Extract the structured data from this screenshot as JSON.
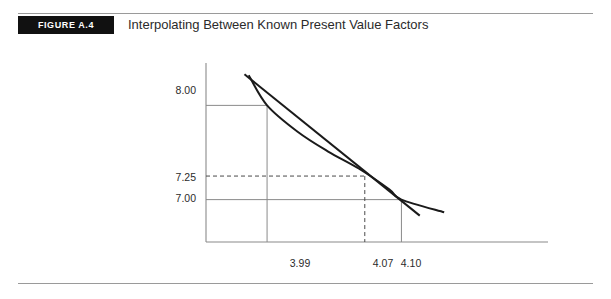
{
  "figure": {
    "tag": "FIGURE A.4",
    "title": "Interpolating Between Known Present Value Factors"
  },
  "chart_data": {
    "type": "line",
    "title": "Interpolating Between Known Present Value Factors",
    "xlabel": "",
    "ylabel": "",
    "grid": true,
    "legend": "none",
    "x_ticks": [
      "3.99",
      "4.07",
      "4.10"
    ],
    "x_tick_values": [
      3.99,
      4.07,
      4.1
    ],
    "y_ticks": [
      "8.00",
      "7.25",
      "7.00"
    ],
    "y_tick_values": [
      8.0,
      7.25,
      7.0
    ],
    "xlim": [
      3.94,
      4.22
    ],
    "ylim": [
      6.55,
      8.45
    ],
    "series": [
      {
        "name": "true-present-value-curve",
        "style": "solid-curve",
        "x": [
          3.975,
          3.99,
          4.015,
          4.04,
          4.065,
          4.09,
          4.1,
          4.135
        ],
        "y": [
          8.32,
          8.0,
          7.72,
          7.51,
          7.33,
          7.11,
          7.0,
          6.865
        ]
      },
      {
        "name": "linear-interpolation-line",
        "style": "solid-straight",
        "x": [
          3.9715,
          3.99,
          4.07,
          4.1,
          4.115
        ],
        "y": [
          8.33,
          8.0,
          7.25,
          7.0,
          6.83
        ]
      }
    ],
    "annotations": [
      {
        "name": "known-point-upper",
        "x": 3.99,
        "y": 8.0,
        "guides": "solid"
      },
      {
        "name": "interpolated-point",
        "x": 4.07,
        "y": 7.25,
        "guides": "dashed"
      },
      {
        "name": "known-point-lower",
        "x": 4.1,
        "y": 7.0,
        "guides": "solid"
      }
    ]
  }
}
